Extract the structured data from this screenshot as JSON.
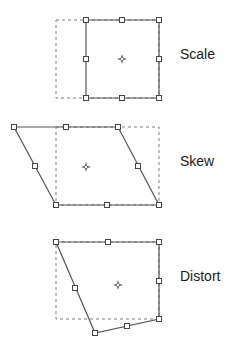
{
  "diagram": {
    "colors": {
      "outline": "#555555",
      "dashed": "#7a7a7a",
      "handle_fill": "#ffffff",
      "handle_stroke": "#444444",
      "text": "#1a1a1a"
    },
    "panels": [
      {
        "id": "scale",
        "label": "Scale",
        "label_pos": [
          180,
          47
        ],
        "original_rect": {
          "x": 56,
          "y": 20,
          "w": 103,
          "h": 78
        },
        "shape": [
          [
            86,
            20
          ],
          [
            159,
            20
          ],
          [
            159,
            98
          ],
          [
            86,
            98
          ]
        ],
        "handles": [
          [
            86,
            20
          ],
          [
            122,
            20
          ],
          [
            159,
            20
          ],
          [
            159,
            59
          ],
          [
            159,
            98
          ],
          [
            122,
            98
          ],
          [
            86,
            98
          ],
          [
            86,
            59
          ]
        ],
        "center": [
          122,
          59
        ]
      },
      {
        "id": "skew",
        "label": "Skew",
        "label_pos": [
          180,
          154
        ],
        "original_rect": {
          "x": 56,
          "y": 127,
          "w": 103,
          "h": 78
        },
        "shape": [
          [
            14,
            127
          ],
          [
            118,
            127
          ],
          [
            159,
            205
          ],
          [
            56,
            205
          ]
        ],
        "handles": [
          [
            14,
            127
          ],
          [
            66,
            127
          ],
          [
            118,
            127
          ],
          [
            138,
            166
          ],
          [
            159,
            205
          ],
          [
            107,
            205
          ],
          [
            56,
            205
          ],
          [
            35,
            166
          ]
        ],
        "center": [
          86,
          167
        ]
      },
      {
        "id": "distort",
        "label": "Distort",
        "label_pos": [
          180,
          269
        ],
        "original_rect": {
          "x": 56,
          "y": 242,
          "w": 103,
          "h": 77
        },
        "shape": [
          [
            56,
            242
          ],
          [
            159,
            242
          ],
          [
            159,
            319
          ],
          [
            95,
            333
          ]
        ],
        "handles": [
          [
            56,
            242
          ],
          [
            108,
            242
          ],
          [
            159,
            242
          ],
          [
            159,
            281
          ],
          [
            159,
            319
          ],
          [
            127,
            326
          ],
          [
            95,
            333
          ],
          [
            75,
            288
          ]
        ],
        "center": [
          118,
          285
        ]
      }
    ]
  }
}
